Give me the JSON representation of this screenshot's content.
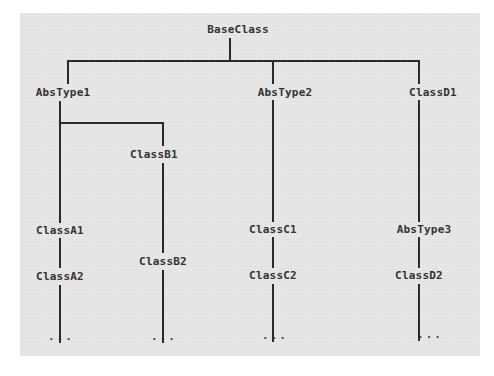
{
  "diagram": {
    "type": "class-hierarchy-tree",
    "root": "BaseClass",
    "nodes": {
      "base": "BaseClass",
      "abs1": "AbsType1",
      "abs2": "AbsType2",
      "d1": "ClassD1",
      "b1": "ClassB1",
      "a1": "ClassA1",
      "a2": "ClassA2",
      "b2": "ClassB2",
      "c1": "ClassC1",
      "c2": "ClassC2",
      "abs3": "AbsType3",
      "d2": "ClassD2"
    },
    "ellipsis": "...",
    "edges": [
      [
        "BaseClass",
        "AbsType1"
      ],
      [
        "BaseClass",
        "AbsType2"
      ],
      [
        "BaseClass",
        "ClassD1"
      ],
      [
        "AbsType1",
        "ClassB1"
      ],
      [
        "AbsType1",
        "ClassA1"
      ],
      [
        "ClassA1",
        "ClassA2"
      ],
      [
        "ClassB1",
        "ClassB2"
      ],
      [
        "AbsType2",
        "ClassC1"
      ],
      [
        "ClassC1",
        "ClassC2"
      ],
      [
        "ClassD1",
        "AbsType3"
      ],
      [
        "AbsType3",
        "ClassD2"
      ]
    ]
  }
}
